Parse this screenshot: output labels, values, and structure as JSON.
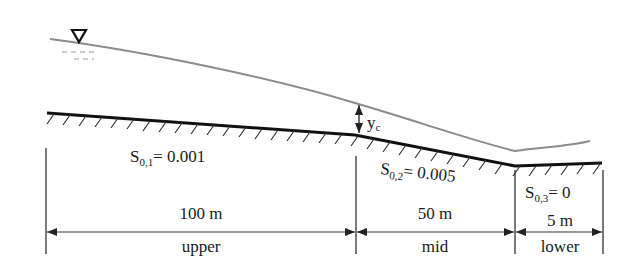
{
  "diagram": {
    "type": "open-channel longitudinal profile",
    "colors": {
      "water_surface": "#8c8c8c",
      "bed": "#111111",
      "hatch": "#333333",
      "dimension": "#333333",
      "text": "#1a1a1a"
    },
    "water_surface_symbol": "free-surface-triangle",
    "critical_depth_label": {
      "main": "y",
      "sub": "c"
    },
    "reaches": [
      {
        "name": "upper",
        "length_label": "100 m",
        "slope_label_main": "S",
        "slope_label_sub": "0,1",
        "slope_value": "= 0.001"
      },
      {
        "name": "mid",
        "length_label": "50 m",
        "slope_label_main": "S",
        "slope_label_sub": "0,2",
        "slope_value": "= 0.005"
      },
      {
        "name": "lower",
        "length_label": "5 m",
        "slope_label_main": "S",
        "slope_label_sub": "0,3",
        "slope_value": "= 0"
      }
    ]
  }
}
